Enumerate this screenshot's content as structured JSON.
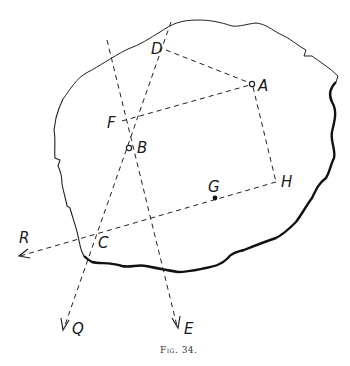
{
  "figure": {
    "caption": "Fig. 34.",
    "points": {
      "A": {
        "label": "A",
        "x": 252,
        "y": 84
      },
      "B": {
        "label": "B",
        "x": 129,
        "y": 148
      },
      "C": {
        "label": "C",
        "x": 98,
        "y": 242
      },
      "D": {
        "label": "D",
        "x": 166,
        "y": 46
      },
      "F": {
        "label": "F",
        "x": 122,
        "y": 121
      },
      "G": {
        "label": "G",
        "x": 215,
        "y": 198
      },
      "H": {
        "label": "H",
        "x": 277,
        "y": 182
      }
    },
    "arrows": {
      "R": {
        "label": "R"
      },
      "Q": {
        "label": "Q"
      },
      "E": {
        "label": "E"
      }
    }
  }
}
